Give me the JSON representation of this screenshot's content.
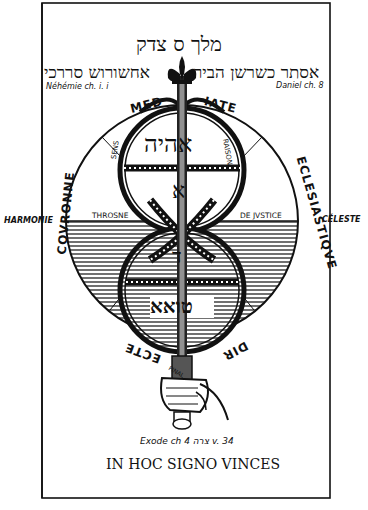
{
  "diagram": {
    "top_hebrew": "מלך ס צדק",
    "left_hebrew": "אחשורוש סררכי",
    "right_hebrew": "אסתר כשרשן הביר",
    "left_ref": "Néhémie ch. i. i",
    "right_ref": "Daniel ch. 8",
    "arc_top_left": "MED",
    "arc_top_right": "IATE",
    "arc_left": "COVRONNE",
    "arc_right": "ECLESIASTIQVE",
    "arc_bottom_left": "ECTE",
    "arc_bottom_right": "DIR",
    "label_harmonie": "HARMONIE",
    "label_celeste": "CÉLESTE",
    "label_throsne": "THROSNE",
    "label_justice": "DE JVSTICE",
    "label_sens": "SENS",
    "label_raison": "RAISON",
    "label_final": "FINAL",
    "upper_circle_hebrew": "אהיה",
    "upper_circle_lower_letter": "א",
    "lower_circle_upper_letter": "ד",
    "lower_circle_hebrew": "טואא",
    "exodus_ref": "Exode ch 4 צרה v. 34",
    "motto": "IN HOC SIGNO VINCES"
  }
}
